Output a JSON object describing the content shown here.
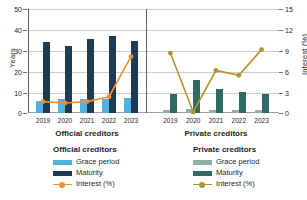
{
  "chart_data": {
    "type": "bar",
    "title": "",
    "xlabel": "",
    "ylabel": "Years",
    "y2label": "Interest (%)",
    "ylim": [
      0,
      50
    ],
    "y2lim": [
      0,
      15
    ],
    "yticks": [
      "0",
      "10",
      "20",
      "30",
      "40",
      "50"
    ],
    "y2ticks": [
      "0",
      "3",
      "6",
      "9",
      "12",
      "15"
    ],
    "grid": true,
    "legend_position": "bottom",
    "categories": [
      "2019",
      "2020",
      "2021",
      "2022",
      "2023"
    ],
    "panels": [
      {
        "name": "Official creditors",
        "series": [
          {
            "name": "Grace period",
            "type": "bar",
            "axis": "left",
            "color": "#4FB4E2",
            "values": [
              6,
              6.5,
              6.5,
              6.5,
              7
            ]
          },
          {
            "name": "Maturity",
            "type": "bar",
            "axis": "left",
            "color": "#1F3B54",
            "values": [
              34,
              32,
              35.5,
              37,
              34.5
            ]
          },
          {
            "name": "Interest (%)",
            "type": "line",
            "axis": "right",
            "color": "#F18F34",
            "values": [
              1.5,
              1.3,
              1.5,
              2.2,
              8.0
            ]
          }
        ]
      },
      {
        "name": "Private creditors",
        "series": [
          {
            "name": "Grace period",
            "type": "bar",
            "axis": "left",
            "color": "#8FB0A8",
            "values": [
              1.5,
              2.0,
              1.5,
              1.5,
              1.5
            ]
          },
          {
            "name": "Maturity",
            "type": "bar",
            "axis": "left",
            "color": "#2F6B63",
            "values": [
              9,
              16,
              11.5,
              10,
              9
            ]
          },
          {
            "name": "Interest (%)",
            "type": "line",
            "axis": "right",
            "color": "#B3922B",
            "values": [
              8.5,
              0,
              6.0,
              5.3,
              9.0
            ]
          }
        ]
      }
    ]
  },
  "axes": {
    "left_title": "Years",
    "right_title": "Interest (%)",
    "left_ticks": [
      "50",
      "40",
      "30",
      "20",
      "10",
      "0"
    ],
    "right_ticks": [
      "15",
      "12",
      "9",
      "6",
      "3",
      "0"
    ]
  },
  "panel_titles": {
    "official": "Official creditors",
    "private": "Private creditors"
  },
  "xaxis": {
    "official": [
      "2019",
      "2020",
      "2021",
      "2022",
      "2023"
    ],
    "private": [
      "2019",
      "2020",
      "2021",
      "2022",
      "2023"
    ]
  },
  "legend": {
    "official": {
      "heading": "Official creditors",
      "items": [
        {
          "label": "Grace period",
          "color": "#4FB4E2",
          "marker": "square"
        },
        {
          "label": "Maturity",
          "color": "#1F3B54",
          "marker": "square"
        },
        {
          "label": "Interest (%)",
          "color": "#F18F34",
          "marker": "line"
        }
      ]
    },
    "private": {
      "heading": "Private creditors",
      "items": [
        {
          "label": "Grace period",
          "color": "#8FB0A8",
          "marker": "square"
        },
        {
          "label": "Maturity",
          "color": "#2F6B63",
          "marker": "square"
        },
        {
          "label": "Interest (%)",
          "color": "#B3922B",
          "marker": "line"
        }
      ]
    }
  }
}
